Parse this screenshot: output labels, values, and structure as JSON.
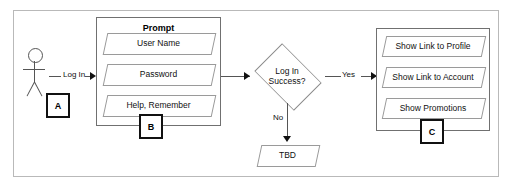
{
  "diagram": {
    "actor": {
      "name": "user-actor",
      "annotation": "A"
    },
    "prompt_group": {
      "title": "Prompt",
      "annotation": "B",
      "items": [
        {
          "label": "User Name"
        },
        {
          "label": "Password"
        },
        {
          "label": "Help, Remember"
        }
      ]
    },
    "decision": {
      "line1": "Log In",
      "line2": "Success?"
    },
    "edges": [
      {
        "label": "Log In"
      },
      {
        "label": "Yes"
      },
      {
        "label": "No"
      }
    ],
    "fail_node": {
      "label": "TBD"
    },
    "success_group": {
      "annotation": "C",
      "items": [
        {
          "label": "Show Link to Profile"
        },
        {
          "label": "Show Link to Account"
        },
        {
          "label": "Show Promotions"
        }
      ]
    },
    "colors": {
      "frame_border": "#b9b9b9",
      "group_border": "#707070",
      "node_border": "#9a9a9a",
      "connector": "#555555",
      "annotation_border": "#111111",
      "text": "#111111"
    }
  }
}
